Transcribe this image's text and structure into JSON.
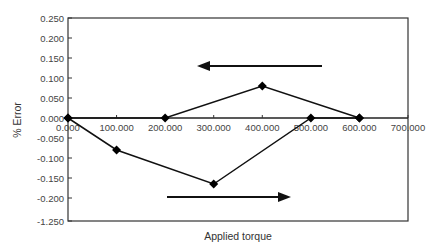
{
  "chart_data": {
    "type": "line",
    "title": "",
    "xlabel": "Applied torque",
    "ylabel": "% Error",
    "xlim": [
      0,
      700
    ],
    "ylim": [
      -0.25,
      0.25
    ],
    "x_ticks": [
      "0.000",
      "100.000",
      "200.000",
      "300.000",
      "400.000",
      "500.000",
      "600.000",
      "700.000"
    ],
    "y_ticks": [
      "0.250",
      "0.200",
      "0.150",
      "0.100",
      "0.050",
      "0.000",
      "-0.050",
      "-0.100",
      "-0.150",
      "-0.200",
      "-1.250"
    ],
    "grid": false,
    "legend": null,
    "series": [
      {
        "name": "Increasing torque",
        "x": [
          0,
          100,
          300,
          500,
          600
        ],
        "y": [
          0.0,
          -0.08,
          -0.165,
          0.0,
          0.0
        ],
        "marker": "diamond"
      },
      {
        "name": "Decreasing torque",
        "x": [
          600,
          400,
          200,
          0
        ],
        "y": [
          0.0,
          0.08,
          0.0,
          0.0
        ],
        "marker": "diamond"
      }
    ],
    "annotations": [
      {
        "type": "arrow",
        "direction": "left",
        "meaning": "decreasing torque (upper branch)"
      },
      {
        "type": "arrow",
        "direction": "right",
        "meaning": "increasing torque (lower branch)"
      }
    ]
  }
}
